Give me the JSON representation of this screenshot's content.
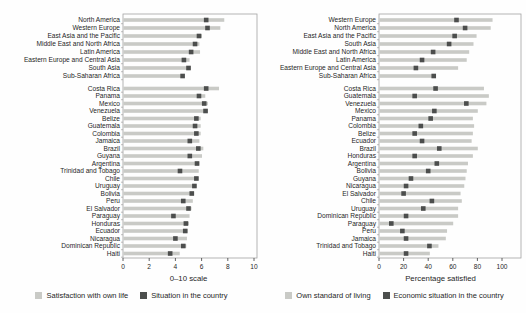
{
  "page": {
    "background": "#fefefe"
  },
  "colors": {
    "bar_light": "#c9cac6",
    "marker_dark": "#4c4e4d",
    "text": "#1f1f1f",
    "frame": "#a3a3a3",
    "axis": "#3c3c3c"
  },
  "chart_data": [
    {
      "type": "bar",
      "orientation": "horizontal",
      "xlabel": "0–10 scale",
      "xlim": [
        0,
        10
      ],
      "xticks": [
        0,
        2,
        4,
        6,
        8,
        10
      ],
      "legend": [
        {
          "label": "Satisfaction with own life",
          "color": "#c9cac6"
        },
        {
          "label": "Situation in the country",
          "color": "#4c4e4d"
        }
      ],
      "groups": [
        {
          "categories": [
            "North America",
            "Western Europe",
            "East Asia and the Pacific",
            "Middle East and North Africa",
            "Latin America",
            "Eastern Europe and Central Asia",
            "South Asia",
            "Sub-Saharan Africa"
          ],
          "series": [
            {
              "name": "Satisfaction with own life",
              "values": [
                7.7,
                7.4,
                6.0,
                5.8,
                5.85,
                5.05,
                5.15,
                4.4
              ]
            },
            {
              "name": "Situation in the country",
              "values": [
                6.35,
                6.45,
                5.8,
                5.5,
                5.2,
                4.65,
                5.0,
                4.55
              ]
            }
          ]
        },
        {
          "categories": [
            "Costa Rica",
            "Panama",
            "Mexico",
            "Venezuela",
            "Belize",
            "Guatemala",
            "Colombia",
            "Jamaica",
            "Brazil",
            "Guyana",
            "Argentina",
            "Trinidad and Tobago",
            "Chile",
            "Uruguay",
            "Bolivia",
            "Peru",
            "El Salvador",
            "Paraguay",
            "Honduras",
            "Ecuador",
            "Nicaragua",
            "Dominican Republic",
            "Haiti"
          ],
          "series": [
            {
              "name": "Satisfaction with own life",
              "values": [
                7.3,
                6.25,
                6.45,
                6.45,
                5.9,
                5.9,
                5.9,
                5.8,
                6.1,
                6.0,
                5.8,
                5.75,
                5.75,
                5.6,
                5.4,
                5.3,
                5.2,
                5.05,
                5.0,
                4.9,
                4.85,
                4.8,
                4.3
              ]
            },
            {
              "name": "Situation in the country",
              "values": [
                6.35,
                5.8,
                6.2,
                6.3,
                5.6,
                5.5,
                5.6,
                5.1,
                5.75,
                5.1,
                5.65,
                4.35,
                5.6,
                5.45,
                5.25,
                4.6,
                5.0,
                3.85,
                4.8,
                4.75,
                4.0,
                4.6,
                3.6
              ]
            }
          ]
        }
      ]
    },
    {
      "type": "bar",
      "orientation": "horizontal",
      "xlabel": "Percentage satisfied",
      "xlim": [
        0,
        100
      ],
      "xticks": [
        0,
        20,
        40,
        60,
        80,
        100
      ],
      "legend": [
        {
          "label": "Own standard of living",
          "color": "#c9cac6"
        },
        {
          "label": "Economic situation in the country",
          "color": "#4c4e4d"
        }
      ],
      "groups": [
        {
          "categories": [
            "Western Europe",
            "North America",
            "East Asia and the Pacific",
            "South Asia",
            "Middle East and North Africa",
            "Latin America",
            "Eastern Europe and Central Asia",
            "Sub-Saharan Africa"
          ],
          "series": [
            {
              "name": "Own standard of living",
              "values": [
                92,
                90.5,
                79,
                76.5,
                73,
                71,
                64,
                45
              ]
            },
            {
              "name": "Economic situation in the country",
              "values": [
                63,
                70,
                61.5,
                57,
                44,
                35,
                30,
                44.5
              ]
            }
          ]
        },
        {
          "categories": [
            "Costa Rica",
            "Guatemala",
            "Venezuela",
            "Mexico",
            "Panama",
            "Colombia",
            "Belize",
            "Ecuador",
            "Brazil",
            "Honduras",
            "Argentina",
            "Bolivia",
            "Guyana",
            "Nicaragua",
            "El Salvador",
            "Chile",
            "Uruguay",
            "Dominican Republic",
            "Paraguay",
            "Peru",
            "Jamaica",
            "Trinidad and Tobago",
            "Haiti"
          ],
          "series": [
            {
              "name": "Own standard of living",
              "values": [
                85,
                89,
                87,
                80,
                76,
                77,
                76,
                75,
                80,
                76,
                72,
                71,
                70,
                69,
                66,
                67,
                64,
                64,
                60,
                55,
                54,
                48,
                41
              ]
            },
            {
              "name": "Economic situation in the country",
              "values": [
                46,
                29,
                71,
                45,
                42,
                34,
                29,
                35,
                49,
                29,
                47,
                40,
                26,
                22,
                20,
                43,
                36,
                22,
                10,
                19,
                22,
                41,
                22
              ]
            }
          ]
        }
      ]
    }
  ]
}
